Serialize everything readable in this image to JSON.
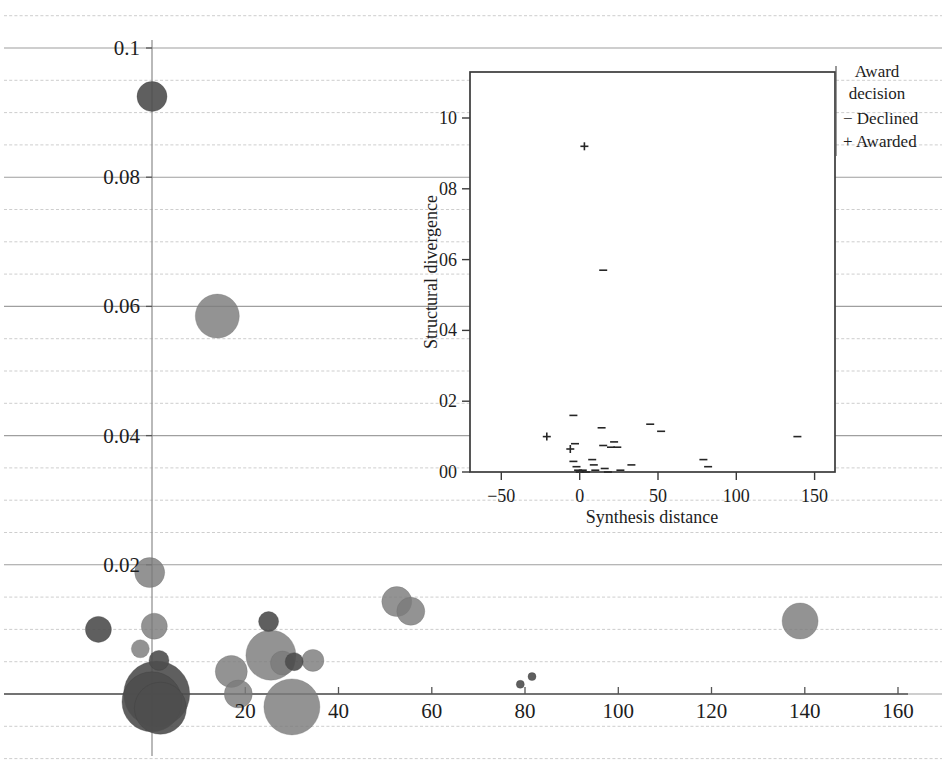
{
  "figure": {
    "background": "#ffffff",
    "bubble_color": "#7b7b7b",
    "bubble_dark_color": "#4e4e4e",
    "grid_color": "#c9c9c9",
    "axis_color": "#555555"
  },
  "chart_data": [
    {
      "id": "main-bubble-chart",
      "type": "scatter",
      "title": "",
      "xlabel": "",
      "ylabel": "",
      "xlim": [
        -4,
        160
      ],
      "ylim": [
        0,
        0.104
      ],
      "xticks": [
        20,
        40,
        60,
        80,
        100,
        120,
        140,
        160
      ],
      "xtick_labels": [
        "20",
        "40",
        "60",
        "80",
        "100",
        "120",
        "140",
        "160"
      ],
      "yticks": [
        0.02,
        0.04,
        0.06,
        0.08,
        0.1
      ],
      "ytick_labels": [
        "0.02",
        "0.04",
        "0.06",
        "0.08",
        "0.1"
      ],
      "grid": true,
      "legend": "none",
      "note": "bubble size encodes a third magnitude variable",
      "points": [
        {
          "x": 0.0,
          "y": 0.0925,
          "size": 15,
          "shade": "dark"
        },
        {
          "x": 14.0,
          "y": 0.0585,
          "size": 22,
          "shade": "mid"
        },
        {
          "x": -0.5,
          "y": 0.0188,
          "size": 15,
          "shade": "mid"
        },
        {
          "x": -11.5,
          "y": 0.01,
          "size": 13,
          "shade": "dark"
        },
        {
          "x": 0.5,
          "y": 0.0105,
          "size": 13,
          "shade": "mid"
        },
        {
          "x": -2.5,
          "y": 0.007,
          "size": 9,
          "shade": "mid"
        },
        {
          "x": 1.5,
          "y": 0.0052,
          "size": 10,
          "shade": "dark"
        },
        {
          "x": 1.0,
          "y": 0.0,
          "size": 33,
          "shade": "dark"
        },
        {
          "x": 0.0,
          "y": -0.0012,
          "size": 30,
          "shade": "dark"
        },
        {
          "x": 1.8,
          "y": -0.0022,
          "size": 26,
          "shade": "dark"
        },
        {
          "x": 17.0,
          "y": 0.0035,
          "size": 16,
          "shade": "mid"
        },
        {
          "x": 18.5,
          "y": 0.0,
          "size": 14,
          "shade": "mid"
        },
        {
          "x": 25.5,
          "y": 0.006,
          "size": 25,
          "shade": "mid"
        },
        {
          "x": 25.0,
          "y": 0.0112,
          "size": 10,
          "shade": "dark"
        },
        {
          "x": 28.0,
          "y": 0.0048,
          "size": 12,
          "shade": "mid"
        },
        {
          "x": 30.5,
          "y": 0.005,
          "size": 9,
          "shade": "dark"
        },
        {
          "x": 30.0,
          "y": -0.002,
          "size": 28,
          "shade": "mid"
        },
        {
          "x": 34.5,
          "y": 0.0052,
          "size": 11,
          "shade": "mid"
        },
        {
          "x": 52.5,
          "y": 0.0143,
          "size": 15,
          "shade": "mid"
        },
        {
          "x": 55.5,
          "y": 0.0128,
          "size": 14,
          "shade": "mid"
        },
        {
          "x": 79.0,
          "y": 0.0015,
          "size": 4,
          "shade": "dark"
        },
        {
          "x": 81.5,
          "y": 0.0027,
          "size": 4,
          "shade": "dark"
        },
        {
          "x": 139.0,
          "y": 0.0113,
          "size": 18,
          "shade": "mid"
        }
      ]
    },
    {
      "id": "inset-scatter",
      "type": "scatter",
      "title": "",
      "xlabel": "Synthesis distance",
      "ylabel": "Structural divergence",
      "xlim": [
        -70,
        163
      ],
      "ylim": [
        0.0,
        0.113
      ],
      "xticks": [
        -50,
        0,
        50,
        100,
        150
      ],
      "xtick_labels": [
        "−50",
        "0",
        "50",
        "100",
        "150"
      ],
      "yticks": [
        0.0,
        0.02,
        0.04,
        0.06,
        0.08,
        0.1
      ],
      "ytick_labels": [
        "00",
        "02",
        "04",
        "06",
        "08",
        "10"
      ],
      "grid": true,
      "legend_title_line1": "Award",
      "legend_title_line2": "decision",
      "legend_entries": [
        {
          "symbol": "−",
          "label": "Declined"
        },
        {
          "symbol": "+",
          "label": "Awarded"
        }
      ],
      "points": [
        {
          "x": 3,
          "y": 0.092,
          "mark": "plus"
        },
        {
          "x": 15,
          "y": 0.057,
          "mark": "minus"
        },
        {
          "x": -21,
          "y": 0.01,
          "mark": "plus"
        },
        {
          "x": -4,
          "y": 0.016,
          "mark": "minus"
        },
        {
          "x": -3,
          "y": 0.008,
          "mark": "minus"
        },
        {
          "x": -6,
          "y": 0.0065,
          "mark": "plus"
        },
        {
          "x": -4,
          "y": 0.003,
          "mark": "minus"
        },
        {
          "x": -2,
          "y": 0.0015,
          "mark": "minus"
        },
        {
          "x": -1,
          "y": 0.0005,
          "mark": "minus"
        },
        {
          "x": 0,
          "y": 0.0,
          "mark": "minus"
        },
        {
          "x": 2,
          "y": 0.0005,
          "mark": "minus"
        },
        {
          "x": 4,
          "y": 0.0,
          "mark": "minus"
        },
        {
          "x": 8,
          "y": 0.0035,
          "mark": "minus"
        },
        {
          "x": 9,
          "y": 0.002,
          "mark": "minus"
        },
        {
          "x": 10,
          "y": 0.0005,
          "mark": "minus"
        },
        {
          "x": 14,
          "y": 0.0125,
          "mark": "minus"
        },
        {
          "x": 15,
          "y": 0.0075,
          "mark": "minus"
        },
        {
          "x": 16,
          "y": 0.001,
          "mark": "minus"
        },
        {
          "x": 18,
          "y": 0.0,
          "mark": "minus"
        },
        {
          "x": 20,
          "y": 0.007,
          "mark": "minus"
        },
        {
          "x": 22,
          "y": 0.0085,
          "mark": "minus"
        },
        {
          "x": 24,
          "y": 0.007,
          "mark": "minus"
        },
        {
          "x": 26,
          "y": 0.0005,
          "mark": "minus"
        },
        {
          "x": 33,
          "y": 0.002,
          "mark": "minus"
        },
        {
          "x": 45,
          "y": 0.0135,
          "mark": "minus"
        },
        {
          "x": 52,
          "y": 0.0115,
          "mark": "minus"
        },
        {
          "x": 79,
          "y": 0.0035,
          "mark": "minus"
        },
        {
          "x": 82,
          "y": 0.0015,
          "mark": "minus"
        },
        {
          "x": 139,
          "y": 0.01,
          "mark": "minus"
        }
      ]
    }
  ]
}
